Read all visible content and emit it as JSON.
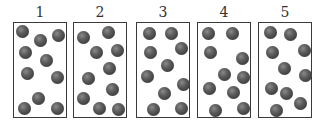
{
  "figure": {
    "particle_color": "#4a4a4a",
    "border_color": "#3a3a3a",
    "particle_radius": 6.5,
    "box_size": {
      "width": 54,
      "height": 96
    },
    "panels": [
      {
        "label": "1",
        "x": 13,
        "particle_count": 10,
        "particles": [
          [
            8,
            8
          ],
          [
            26,
            17
          ],
          [
            44,
            12
          ],
          [
            11,
            29
          ],
          [
            32,
            37
          ],
          [
            13,
            50
          ],
          [
            43,
            54
          ],
          [
            24,
            75
          ],
          [
            10,
            85
          ],
          [
            43,
            85
          ]
        ]
      },
      {
        "label": "2",
        "x": 73,
        "particle_count": 10,
        "particles": [
          [
            9,
            14
          ],
          [
            34,
            9
          ],
          [
            22,
            29
          ],
          [
            43,
            27
          ],
          [
            35,
            45
          ],
          [
            14,
            55
          ],
          [
            38,
            66
          ],
          [
            9,
            75
          ],
          [
            25,
            85
          ],
          [
            44,
            86
          ]
        ]
      },
      {
        "label": "3",
        "x": 136,
        "particle_count": 10,
        "particles": [
          [
            12,
            10
          ],
          [
            34,
            10
          ],
          [
            13,
            29
          ],
          [
            44,
            25
          ],
          [
            30,
            42
          ],
          [
            10,
            53
          ],
          [
            46,
            61
          ],
          [
            27,
            70
          ],
          [
            16,
            86
          ],
          [
            44,
            85
          ]
        ]
      },
      {
        "label": "4",
        "x": 197,
        "particle_count": 10,
        "particles": [
          [
            10,
            10
          ],
          [
            34,
            10
          ],
          [
            12,
            29
          ],
          [
            44,
            35
          ],
          [
            26,
            51
          ],
          [
            45,
            54
          ],
          [
            11,
            65
          ],
          [
            35,
            69
          ],
          [
            17,
            87
          ],
          [
            45,
            85
          ]
        ]
      },
      {
        "label": "5",
        "x": 258,
        "particle_count": 10,
        "particles": [
          [
            11,
            9
          ],
          [
            31,
            11
          ],
          [
            13,
            29
          ],
          [
            45,
            27
          ],
          [
            25,
            45
          ],
          [
            46,
            52
          ],
          [
            12,
            65
          ],
          [
            27,
            70
          ],
          [
            41,
            80
          ],
          [
            17,
            87
          ]
        ]
      }
    ]
  }
}
